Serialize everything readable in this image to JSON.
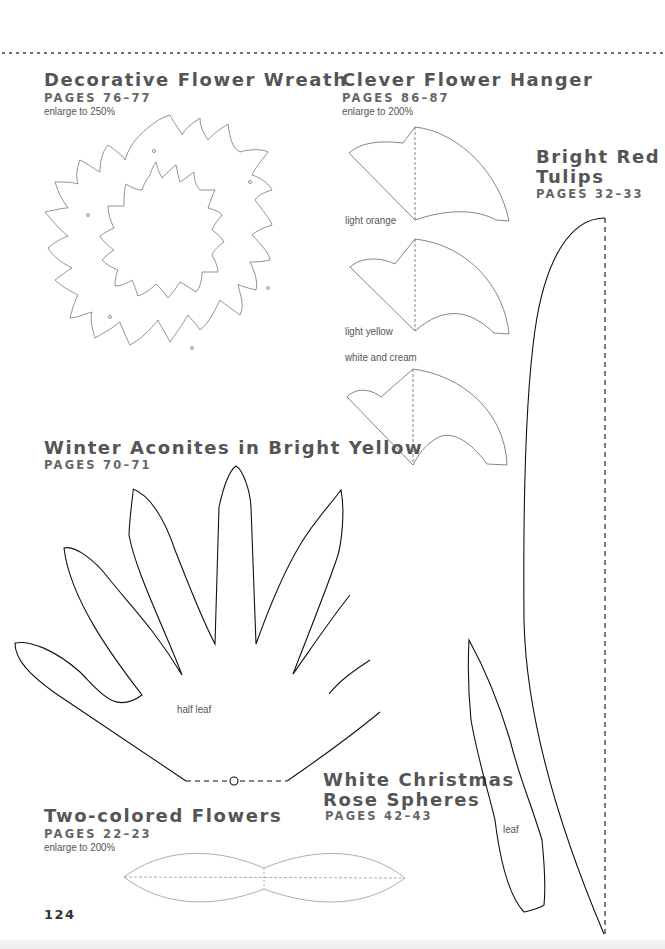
{
  "page": {
    "number": "124",
    "divider": "dotted-rule"
  },
  "sections": {
    "wreath": {
      "title": "Decorative Flower Wreath",
      "pages": "PAGES 76–77",
      "note": "enlarge to 250%"
    },
    "hanger": {
      "title": "Clever Flower Hanger",
      "pages": "PAGES 86–87",
      "note": "enlarge to 200%",
      "labels": [
        "light orange",
        "light yellow",
        "white and cream"
      ]
    },
    "tulips": {
      "title_line1": "Bright Red",
      "title_line2": "Tulips",
      "pages": "PAGES 32–33",
      "leaf_label": "leaf"
    },
    "aconites": {
      "title": "Winter Aconites in Bright Yellow",
      "pages": "PAGES 70–71",
      "label": "half leaf"
    },
    "christmas_rose": {
      "title_line1": "White Christmas",
      "title_line2": "Rose Spheres",
      "pages": "PAGES 42–43"
    },
    "two_colored": {
      "title": "Two-colored Flowers",
      "pages": "PAGES 22–23",
      "note": "enlarge to 200%"
    }
  },
  "colors": {
    "heading": "#555555",
    "outline_light": "#777777",
    "outline_dark": "#111111"
  }
}
